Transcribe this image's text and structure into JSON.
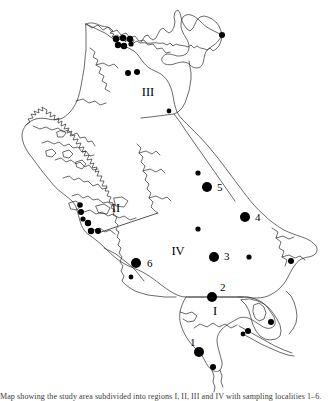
{
  "figure": {
    "background_color": "#ffffff",
    "coast_color": "#2b2b2b",
    "boundary_color": "#555555",
    "dot_color": "#000000",
    "width": 334,
    "height": 401
  },
  "caption": {
    "text": "Map showing the study area subdivided into regions I, II, III and IV with sampling localities 1–6."
  },
  "regions": [
    {
      "id": "I",
      "label": "I",
      "x": 215,
      "y": 315
    },
    {
      "id": "II",
      "label": "II",
      "x": 116,
      "y": 212
    },
    {
      "id": "III",
      "label": "III",
      "x": 148,
      "y": 96
    },
    {
      "id": "IV",
      "label": "IV",
      "x": 178,
      "y": 255
    }
  ],
  "numbered_sites": [
    {
      "number": "1",
      "x": 199,
      "y": 352,
      "r": 5.0,
      "label_x": 190,
      "label_y": 346
    },
    {
      "number": "2",
      "x": 212,
      "y": 297,
      "r": 5.0,
      "label_x": 220,
      "label_y": 291
    },
    {
      "number": "3",
      "x": 214,
      "y": 257,
      "r": 5.0,
      "label_x": 224,
      "label_y": 260
    },
    {
      "number": "4",
      "x": 245,
      "y": 217,
      "r": 5.0,
      "label_x": 255,
      "label_y": 221
    },
    {
      "number": "5",
      "x": 207,
      "y": 187,
      "r": 5.0,
      "label_x": 217,
      "label_y": 191
    },
    {
      "number": "6",
      "x": 136,
      "y": 263,
      "r": 5.0,
      "label_x": 147,
      "label_y": 267
    }
  ],
  "unnumbered_sites": [
    {
      "x": 116,
      "y": 39,
      "r": 3.2
    },
    {
      "x": 123,
      "y": 38,
      "r": 3.2
    },
    {
      "x": 130,
      "y": 39,
      "r": 3.2
    },
    {
      "x": 118,
      "y": 45,
      "r": 3.2
    },
    {
      "x": 124,
      "y": 46,
      "r": 3.2
    },
    {
      "x": 131,
      "y": 44,
      "r": 2.6
    },
    {
      "x": 222,
      "y": 35,
      "r": 3.0
    },
    {
      "x": 128,
      "y": 73,
      "r": 3.0
    },
    {
      "x": 137,
      "y": 72,
      "r": 3.0
    },
    {
      "x": 169,
      "y": 111,
      "r": 2.4
    },
    {
      "x": 198,
      "y": 173,
      "r": 2.6
    },
    {
      "x": 198,
      "y": 229,
      "r": 2.6
    },
    {
      "x": 249,
      "y": 257,
      "r": 2.6
    },
    {
      "x": 291,
      "y": 261,
      "r": 3.0
    },
    {
      "x": 80,
      "y": 205,
      "r": 2.8
    },
    {
      "x": 81,
      "y": 212,
      "r": 3.0
    },
    {
      "x": 83,
      "y": 219,
      "r": 2.6
    },
    {
      "x": 88,
      "y": 223,
      "r": 3.2
    },
    {
      "x": 91,
      "y": 231,
      "r": 3.2
    },
    {
      "x": 98,
      "y": 231,
      "r": 3.0
    },
    {
      "x": 131,
      "y": 277,
      "r": 2.4
    },
    {
      "x": 271,
      "y": 322,
      "r": 3.0
    },
    {
      "x": 248,
      "y": 331,
      "r": 3.0
    },
    {
      "x": 243,
      "y": 334,
      "r": 2.4
    },
    {
      "x": 213,
      "y": 367,
      "r": 3.0
    }
  ],
  "boundary_lines": [
    {
      "id": "boundary-ii-iv",
      "points": "98,233 158,213"
    },
    {
      "id": "boundary-i-iv",
      "points": "186,297 243,297"
    }
  ]
}
